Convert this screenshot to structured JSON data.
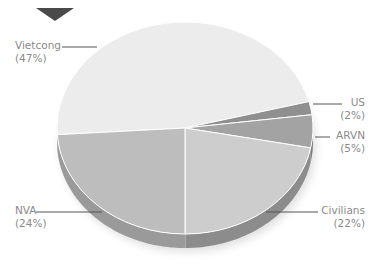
{
  "chart_data": {
    "type": "pie",
    "title": "",
    "style": "3d-tilted",
    "categories": [
      "Vietcong",
      "US",
      "ARVN",
      "Civilians",
      "NVA"
    ],
    "values": [
      47,
      2,
      5,
      22,
      24
    ],
    "unit": "%",
    "colors": {
      "Vietcong": "#ececec",
      "US": "#8f8f8f",
      "ARVN": "#a3a3a3",
      "Civilians": "#cdcdcd",
      "NVA": "#bdbdbd"
    },
    "labels": [
      {
        "name": "Vietcong",
        "pct": "(47%)"
      },
      {
        "name": "US",
        "pct": "(2%)"
      },
      {
        "name": "ARVN",
        "pct": "(5%)"
      },
      {
        "name": "Civilians",
        "pct": "(22%)"
      },
      {
        "name": "NVA",
        "pct": "(24%)"
      }
    ],
    "legend": "callout labels beside slices",
    "marker": "down-pointing triangle at top-left"
  }
}
